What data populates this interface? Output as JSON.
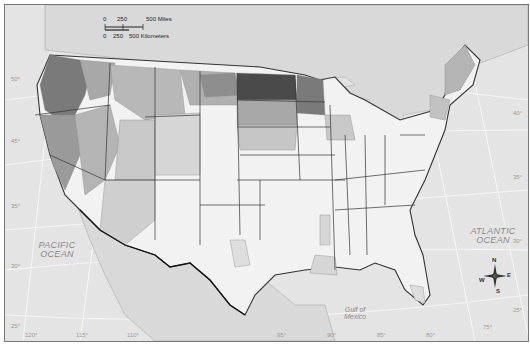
{
  "map": {
    "title": "",
    "region": "Contiguous United States",
    "background_color": "#e4e4e4",
    "land_outside_color": "#d6d6d6",
    "shade_levels": [
      "#f2f2f2",
      "#dedede",
      "#c8c8c8",
      "#b0b0b0",
      "#8f8f8f",
      "#6e6e6e",
      "#4a4a4a"
    ]
  },
  "labels": {
    "pacific": [
      "PACIFIC",
      "OCEAN"
    ],
    "atlantic": [
      "ATLANTIC",
      "OCEAN"
    ],
    "gulf": [
      "Gulf of",
      "Mexico"
    ]
  },
  "scale_bar": {
    "miles": {
      "ticks": [
        "0",
        "250",
        "500 Miles"
      ]
    },
    "kilometers": {
      "ticks": [
        "0",
        "250",
        "500 Kilometers"
      ]
    }
  },
  "compass": {
    "n": "N",
    "s": "S",
    "e": "E",
    "w": "W"
  },
  "graticule": {
    "latitudes_left": [
      "50°",
      "45°",
      "35°",
      "30°",
      "25°"
    ],
    "latitudes_right": [
      "40°",
      "35°",
      "30°",
      "25°"
    ],
    "longitudes_bottom": [
      "120°",
      "115°",
      "110°",
      "95°",
      "90°",
      "85°",
      "80°",
      "75°"
    ]
  }
}
